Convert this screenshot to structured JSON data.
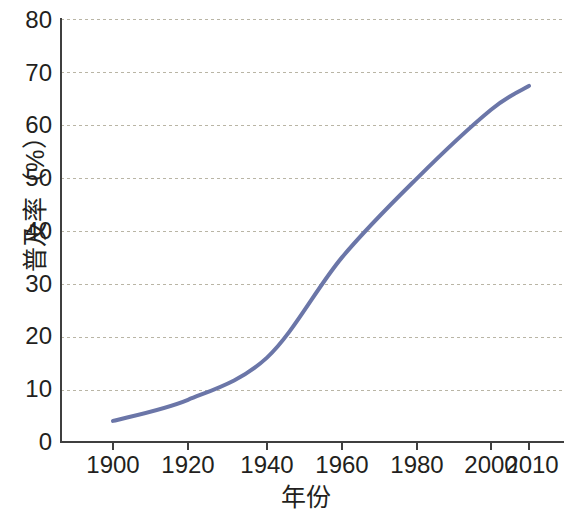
{
  "chart_data": {
    "type": "line",
    "title": "",
    "xlabel": "年份",
    "ylabel": "普及率（%）",
    "x": [
      1900,
      1920,
      1940,
      1960,
      1980,
      2000,
      2010
    ],
    "values": [
      4,
      8,
      16,
      35,
      50,
      63,
      67.5
    ],
    "series": [
      {
        "name": "普及率",
        "values": [
          4,
          8,
          16,
          35,
          50,
          63,
          67.5
        ]
      }
    ],
    "xlim": [
      1886,
      1920
    ],
    "ylim": [
      0,
      80
    ],
    "xticks": [
      1900,
      1920,
      1940,
      1960,
      1980,
      2000,
      2010
    ],
    "xtick_labels": [
      "1900",
      "1920",
      "1940",
      "1960",
      "1980",
      "2000",
      "2010"
    ],
    "yticks": [
      0,
      10,
      20,
      30,
      40,
      50,
      60,
      70,
      80
    ],
    "ytick_labels": [
      "0",
      "10",
      "20",
      "30",
      "40",
      "50",
      "60",
      "70",
      "80"
    ],
    "grid": "horizontal-dashed",
    "legend": "none",
    "line_color": "#6b76a8",
    "axis_color": "#3f3f3f",
    "grid_color": "#b9b5a5",
    "background": "#ffffff"
  }
}
